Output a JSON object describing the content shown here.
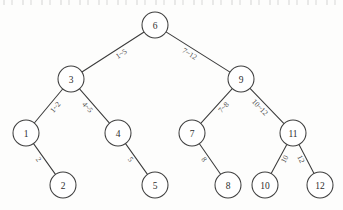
{
  "figure": {
    "type": "binary-search-tree",
    "background_color": "#fdfdfc",
    "stroke_color": "#3f3f3f",
    "text_color": "#2e2e2e",
    "width": 343,
    "height": 210,
    "node_radius": 13,
    "scan_artifact_top": "faint cropped text remnants along the top edge"
  },
  "nodes": [
    {
      "id": "n6",
      "label": "6",
      "x": 155,
      "y": 25,
      "level": 0
    },
    {
      "id": "n3",
      "label": "3",
      "x": 71,
      "y": 79,
      "level": 1
    },
    {
      "id": "n9",
      "label": "9",
      "x": 241,
      "y": 79,
      "level": 1
    },
    {
      "id": "n1",
      "label": "1",
      "x": 26,
      "y": 133,
      "level": 2
    },
    {
      "id": "n4",
      "label": "4",
      "x": 118,
      "y": 133,
      "level": 2
    },
    {
      "id": "n7",
      "label": "7",
      "x": 192,
      "y": 133,
      "level": 2
    },
    {
      "id": "n11",
      "label": "11",
      "x": 293,
      "y": 133,
      "level": 2
    },
    {
      "id": "n2",
      "label": "2",
      "x": 63,
      "y": 185,
      "level": 3
    },
    {
      "id": "n5",
      "label": "5",
      "x": 155,
      "y": 185,
      "level": 3
    },
    {
      "id": "n8",
      "label": "8",
      "x": 228,
      "y": 185,
      "level": 3
    },
    {
      "id": "n10",
      "label": "10",
      "x": 265,
      "y": 185,
      "level": 3
    },
    {
      "id": "n12",
      "label": "12",
      "x": 320,
      "y": 185,
      "level": 3
    }
  ],
  "edges": [
    {
      "id": "e6-3",
      "from": "n6",
      "to": "n3",
      "label": "1~5",
      "side": "left",
      "label_offset": 6
    },
    {
      "id": "e6-9",
      "from": "n6",
      "to": "n9",
      "label": "7~12",
      "side": "right",
      "label_offset": 6
    },
    {
      "id": "e3-1",
      "from": "n3",
      "to": "n1",
      "label": "1~2",
      "side": "left",
      "label_offset": 6
    },
    {
      "id": "e3-4",
      "from": "n3",
      "to": "n4",
      "label": "4~5",
      "side": "right",
      "label_offset": 6
    },
    {
      "id": "e9-7",
      "from": "n9",
      "to": "n7",
      "label": "7~8",
      "side": "left",
      "label_offset": 6
    },
    {
      "id": "e9-11",
      "from": "n9",
      "to": "n11",
      "label": "10~12",
      "side": "right",
      "label_offset": 6
    },
    {
      "id": "e1-2",
      "from": "n1",
      "to": "n2",
      "label": "2",
      "side": "right",
      "label_offset": 5
    },
    {
      "id": "e4-5",
      "from": "n4",
      "to": "n5",
      "label": "5",
      "side": "right",
      "label_offset": 5
    },
    {
      "id": "e7-8",
      "from": "n7",
      "to": "n8",
      "label": "8",
      "side": "right",
      "label_offset": 5
    },
    {
      "id": "e11-10",
      "from": "n11",
      "to": "n10",
      "label": "10",
      "side": "left",
      "label_offset": 5
    },
    {
      "id": "e11-12",
      "from": "n11",
      "to": "n12",
      "label": "12",
      "side": "right",
      "label_offset": 5
    }
  ]
}
